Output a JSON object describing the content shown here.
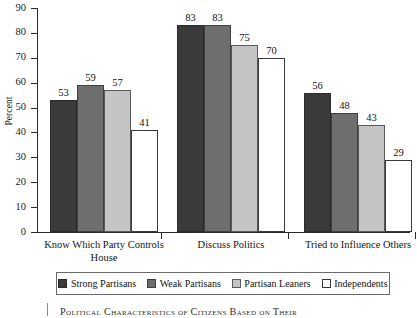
{
  "chart_data": {
    "type": "bar",
    "title": "",
    "xlabel": "",
    "ylabel": "Percent",
    "ylim": [
      0,
      90
    ],
    "ytick_step": 10,
    "yticks": [
      0,
      10,
      20,
      30,
      40,
      50,
      60,
      70,
      80,
      90
    ],
    "grid": false,
    "legend_position": "bottom",
    "categories": [
      "Know Which Party Controls\nHouse",
      "Discuss Politics",
      "Tried to Influence Others"
    ],
    "series": [
      {
        "name": "Strong Partisans",
        "color": "#3a3a3a",
        "values": [
          53,
          83,
          56
        ]
      },
      {
        "name": "Weak Partisans",
        "color": "#6e6e6e",
        "values": [
          59,
          83,
          48
        ]
      },
      {
        "name": "Partisan Leaners",
        "color": "#c4c4c4",
        "values": [
          57,
          75,
          43
        ]
      },
      {
        "name": "Independents",
        "color": "#ffffff",
        "values": [
          41,
          70,
          29
        ]
      }
    ],
    "data_labels": true,
    "caption": "Political Characteristics of Citizens Based on Their"
  },
  "axis": {
    "y_label": "Percent"
  },
  "caption": {
    "text": "Political Characteristics of Citizens Based on Their"
  }
}
